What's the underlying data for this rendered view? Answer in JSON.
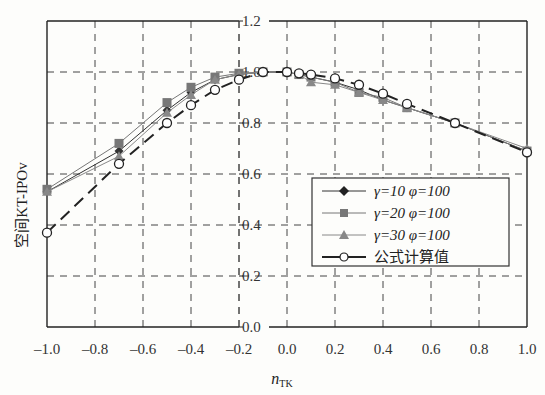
{
  "chart_data": {
    "type": "line",
    "title": "",
    "xlabel": "n_TK",
    "xlabel_main": "n",
    "xlabel_sub": "TK",
    "ylabel": "空间KT-IPOv",
    "xlim": [
      -1.0,
      1.0
    ],
    "ylim": [
      0.0,
      1.2
    ],
    "grid": true,
    "grid_style": "dashed",
    "legend_position": "lower right (inside)",
    "x_ticks": [
      "-1.0",
      "-0.8",
      "-0.6",
      "-0.4",
      "-0.2",
      "0.0",
      "0.2",
      "0.4",
      "0.6",
      "0.8",
      "1.0"
    ],
    "x_tick_values": [
      -1.0,
      -0.8,
      -0.6,
      -0.4,
      -0.2,
      0.0,
      0.2,
      0.4,
      0.6,
      0.8,
      1.0
    ],
    "y_ticks": [
      "0.0",
      "0.2",
      "0.4",
      "0.6",
      "0.8",
      "1.0",
      "1.2"
    ],
    "y_tick_values": [
      0.0,
      0.2,
      0.4,
      0.6,
      0.8,
      1.0,
      1.2
    ],
    "y_axis_position_x": -0.2,
    "series": [
      {
        "name": "γ=10 φ=100",
        "marker": "diamond",
        "color": "#333333",
        "line": "solid-thin",
        "x": [
          -1.0,
          -0.7,
          -0.5,
          -0.4,
          -0.3,
          -0.2,
          -0.1,
          0.0,
          0.05,
          0.1,
          0.2,
          0.3,
          0.4,
          0.5,
          0.7,
          1.0
        ],
        "y": [
          0.53,
          0.69,
          0.85,
          0.92,
          0.97,
          0.99,
          1.0,
          1.0,
          0.99,
          0.98,
          0.96,
          0.93,
          0.89,
          0.86,
          0.8,
          0.69
        ]
      },
      {
        "name": "γ=20 φ=100",
        "marker": "square",
        "color": "#777777",
        "line": "solid-thin",
        "x": [
          -1.0,
          -0.7,
          -0.5,
          -0.4,
          -0.3,
          -0.2,
          -0.1,
          0.0,
          0.05,
          0.1,
          0.2,
          0.3,
          0.4,
          0.5,
          0.7,
          1.0
        ],
        "y": [
          0.54,
          0.72,
          0.88,
          0.94,
          0.98,
          0.995,
          1.0,
          1.0,
          0.99,
          0.98,
          0.96,
          0.92,
          0.9,
          0.86,
          0.8,
          0.69
        ]
      },
      {
        "name": "γ=30 φ=100",
        "marker": "triangle",
        "color": "#888888",
        "line": "solid-thin",
        "x": [
          -1.0,
          -0.7,
          -0.5,
          -0.4,
          -0.3,
          -0.2,
          -0.1,
          0.0,
          0.05,
          0.1,
          0.2,
          0.3,
          0.4,
          0.5,
          0.7,
          1.0
        ],
        "y": [
          0.53,
          0.67,
          0.84,
          0.91,
          0.97,
          0.99,
          1.0,
          1.0,
          0.99,
          0.96,
          0.95,
          0.92,
          0.89,
          0.86,
          0.8,
          0.7
        ]
      },
      {
        "name": "公式计算值",
        "marker": "open-circle",
        "color": "#222222",
        "line": "dashed-thick",
        "x": [
          -1.0,
          -0.7,
          -0.5,
          -0.4,
          -0.3,
          -0.2,
          -0.1,
          0.0,
          0.05,
          0.1,
          0.2,
          0.3,
          0.4,
          0.5,
          0.7,
          1.0
        ],
        "y": [
          0.37,
          0.64,
          0.8,
          0.87,
          0.93,
          0.97,
          1.0,
          1.0,
          0.995,
          0.99,
          0.975,
          0.95,
          0.915,
          0.875,
          0.8,
          0.685
        ]
      }
    ]
  },
  "legend": {
    "items": [
      {
        "label": "γ=10 φ=100",
        "marker": "diamond"
      },
      {
        "label": "γ=20 φ=100",
        "marker": "square"
      },
      {
        "label": "γ=30 φ=100",
        "marker": "triangle"
      },
      {
        "label": "公式计算值",
        "marker": "open-circle"
      }
    ]
  },
  "axes": {
    "ylabel": "空间KT-IPOv",
    "xlabel_main": "n",
    "xlabel_sub": "TK"
  }
}
